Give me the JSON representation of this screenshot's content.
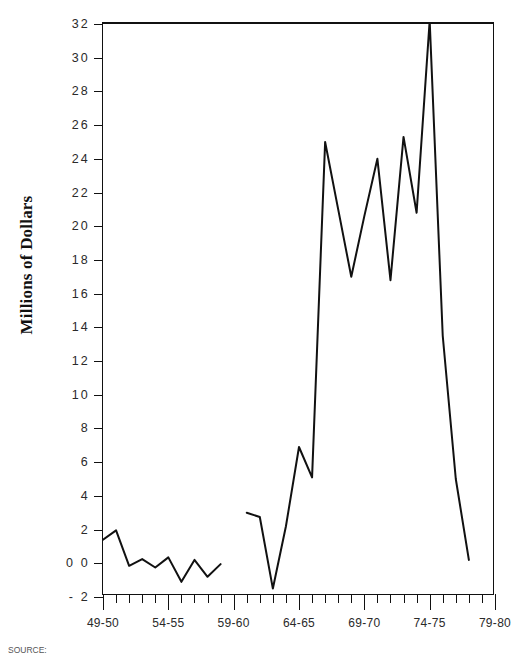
{
  "chart_data": {
    "type": "line",
    "title": "",
    "subtitle": "",
    "xlabel": "",
    "ylabel": "Millions of Dollars",
    "ylim": [
      -2,
      32
    ],
    "ytick_values": [
      -2,
      0,
      2,
      4,
      6,
      8,
      10,
      12,
      14,
      16,
      18,
      20,
      22,
      24,
      26,
      28,
      30,
      32
    ],
    "ytick_labels": [
      "- 2",
      "0 0",
      "2",
      "4",
      "6",
      "8",
      "10",
      "12",
      "14",
      "16",
      "18",
      "20",
      "22",
      "24",
      "26",
      "28",
      "30",
      "32"
    ],
    "grid": false,
    "legend": null,
    "legend_position": "none",
    "line_color": "#111111",
    "x_index_range": [
      0,
      30
    ],
    "xtick_major_labels": [
      "49-50",
      "54-55",
      "59-60",
      "64-65",
      "69-70",
      "74-75",
      "79-80"
    ],
    "xtick_major_indices": [
      0,
      5,
      10,
      15,
      20,
      25,
      30
    ],
    "xtick_minor_count": 31,
    "series": [
      {
        "name": "Fiscal year value",
        "note": "Data gap between 59-60 and 61-62 region",
        "points": [
          {
            "x": 0,
            "label": "49-50",
            "y": 1.4
          },
          {
            "x": 1,
            "label": "50-51",
            "y": 1.95
          },
          {
            "x": 2,
            "label": "51-52",
            "y": -0.15
          },
          {
            "x": 3,
            "label": "52-53",
            "y": 0.25
          },
          {
            "x": 4,
            "label": "53-54",
            "y": -0.25
          },
          {
            "x": 5,
            "label": "54-55",
            "y": 0.35
          },
          {
            "x": 6,
            "label": "55-56",
            "y": -1.1
          },
          {
            "x": 7,
            "label": "56-57",
            "y": 0.2
          },
          {
            "x": 8,
            "label": "57-58",
            "y": -0.8
          },
          {
            "x": 9,
            "label": "58-59",
            "y": -0.05
          },
          {
            "x": 11,
            "label": "60-61",
            "y": 3.0
          },
          {
            "x": 12,
            "label": "61-62",
            "y": 2.75
          },
          {
            "x": 13,
            "label": "62-63",
            "y": -1.5
          },
          {
            "x": 14,
            "label": "63-64",
            "y": 2.2
          },
          {
            "x": 15,
            "label": "64-65",
            "y": 6.9
          },
          {
            "x": 16,
            "label": "65-66",
            "y": 5.1
          },
          {
            "x": 17,
            "label": "66-67",
            "y": 25.0
          },
          {
            "x": 18,
            "label": "67-68",
            "y": 21.0
          },
          {
            "x": 19,
            "label": "68-69",
            "y": 17.0
          },
          {
            "x": 20,
            "label": "69-70",
            "y": 20.6
          },
          {
            "x": 21,
            "label": "70-71",
            "y": 24.0
          },
          {
            "x": 22,
            "label": "71-72",
            "y": 16.8
          },
          {
            "x": 23,
            "label": "72-73",
            "y": 25.3
          },
          {
            "x": 24,
            "label": "73-74",
            "y": 20.8
          },
          {
            "x": 25,
            "label": "74-75",
            "y": 32.2
          },
          {
            "x": 26,
            "label": "75-76",
            "y": 13.5
          },
          {
            "x": 27,
            "label": "76-77",
            "y": 5.0
          },
          {
            "x": 28,
            "label": "77-78",
            "y": 0.2
          }
        ]
      }
    ]
  },
  "source_caption": "SOURCE:"
}
